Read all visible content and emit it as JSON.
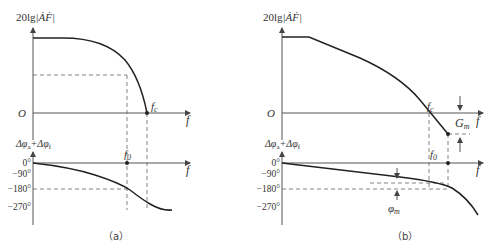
{
  "figure": {
    "panel_a": {
      "caption": "（a）",
      "mag_ylabel_prefix": "20lg",
      "mag_ylabel_expr": "|ȦḞ|",
      "origin_label": "O",
      "x_axis_label": "f",
      "fc_label": "f",
      "fc_sub": "c",
      "phase_ylabel": "Δφ",
      "phase_ylabel_sub_a": "a",
      "phase_ylabel_plus": "+Δφ",
      "phase_ylabel_sub_f": "f",
      "f0_label": "f",
      "f0_sub": "0",
      "phase_ticks": [
        "0°",
        "−90°",
        "−180°",
        "−270°"
      ]
    },
    "panel_b": {
      "caption": "（b）",
      "mag_ylabel_prefix": "20lg",
      "mag_ylabel_expr": "|ȦḞ|",
      "origin_label": "O",
      "x_axis_label": "f",
      "fc_label": "f",
      "fc_sub": "c",
      "gm_label": "G",
      "gm_sub": "m",
      "phase_ylabel": "Δφ",
      "phase_ylabel_sub_a": "a",
      "phase_ylabel_plus": "+Δφ",
      "phase_ylabel_sub_f": "f",
      "f0_label": "f",
      "f0_sub": "0",
      "pm_label": "φ",
      "pm_sub": "m",
      "phase_ticks": [
        "0°",
        "−90°",
        "−180°",
        "−270°"
      ]
    }
  }
}
